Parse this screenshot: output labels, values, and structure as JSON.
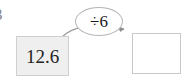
{
  "diagram": {
    "type": "function-machine",
    "background_color": "#ffffff",
    "edge_fragment": {
      "text": "3",
      "note_visible_text": "partially cropped character at left edge"
    },
    "input_box": {
      "value": "12.6",
      "fill_color": "#efefef",
      "border_color": "#cfcfcf"
    },
    "operator_bubble": {
      "label": "÷6",
      "operation": "divide",
      "operand": "6",
      "fill_color": "#ffffff",
      "border_color": "#b5b5b5"
    },
    "output_box": {
      "value": "",
      "fill_color": "#ffffff",
      "border_color": "#c9c9c9"
    },
    "arrow": {
      "color": "#9a9a9a",
      "direction": "left-to-right"
    }
  }
}
